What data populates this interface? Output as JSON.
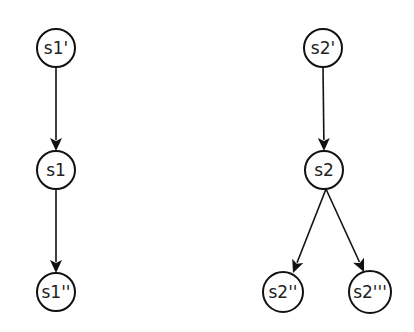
{
  "diagram": {
    "type": "tree",
    "background": "#ffffff",
    "stroke_color": "#111111",
    "text_color": "#222222",
    "nodes": [
      {
        "id": "s1p",
        "label": "s1'",
        "cx": 56,
        "cy": 48,
        "r": 19
      },
      {
        "id": "s1",
        "label": "s1",
        "cx": 56,
        "cy": 170,
        "r": 19
      },
      {
        "id": "s1pp",
        "label": "s1''",
        "cx": 56,
        "cy": 292,
        "r": 19
      },
      {
        "id": "s2p",
        "label": "s2'",
        "cx": 323,
        "cy": 48,
        "r": 19
      },
      {
        "id": "s2",
        "label": "s2",
        "cx": 324,
        "cy": 170,
        "r": 19
      },
      {
        "id": "s2pp",
        "label": "s2''",
        "cx": 283,
        "cy": 292,
        "r": 20
      },
      {
        "id": "s2ppp",
        "label": "s2'''",
        "cx": 370,
        "cy": 292,
        "r": 21
      }
    ],
    "edges": [
      {
        "from": "s1p",
        "to": "s1",
        "x1": 56,
        "y1": 67,
        "x2": 56,
        "y2": 151
      },
      {
        "from": "s1",
        "to": "s1pp",
        "x1": 56,
        "y1": 189,
        "x2": 56,
        "y2": 273
      },
      {
        "from": "s2p",
        "to": "s2",
        "x1": 323,
        "y1": 67,
        "x2": 324,
        "y2": 151
      },
      {
        "from": "s2",
        "to": "s2pp",
        "x1": 326,
        "y1": 189,
        "x2": 293,
        "y2": 273
      },
      {
        "from": "s2",
        "to": "s2ppp",
        "x1": 326,
        "y1": 189,
        "x2": 364,
        "y2": 272
      }
    ]
  }
}
